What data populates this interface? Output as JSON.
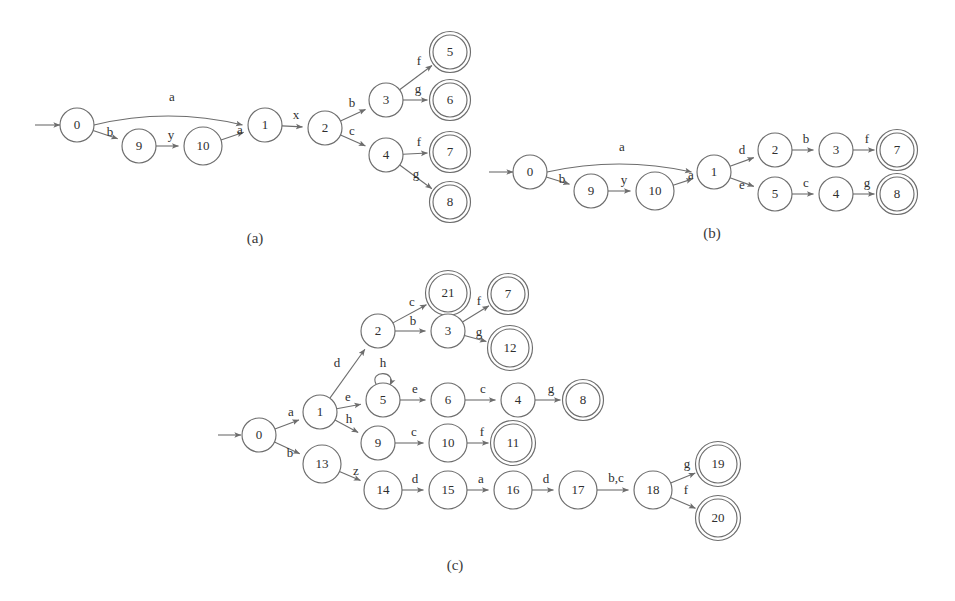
{
  "figure": {
    "type": "finite-state-automata-diagrams",
    "background_color": "#ffffff",
    "stroke_color": "#6d6d6d",
    "text_color": "#2f2f2f",
    "captions": [
      {
        "id": "caption-a",
        "text": "(a)",
        "x": 255,
        "y": 240
      },
      {
        "id": "caption-b",
        "text": "(b)",
        "x": 712,
        "y": 235
      },
      {
        "id": "caption-c",
        "text": "(c)",
        "x": 455,
        "y": 567
      }
    ],
    "diagrams": [
      {
        "id": "diagram-a",
        "caption": "(a)",
        "start_arrow": {
          "x1": 35,
          "y1": 125,
          "x2": 60,
          "y2": 125
        },
        "nodes": [
          {
            "id": "a0",
            "label": "0",
            "x": 77,
            "y": 125,
            "r": 17,
            "accepting": false
          },
          {
            "id": "a9",
            "label": "9",
            "x": 139,
            "y": 146,
            "r": 17,
            "accepting": false
          },
          {
            "id": "a10",
            "label": "10",
            "x": 203,
            "y": 146,
            "r": 19,
            "accepting": false
          },
          {
            "id": "a1",
            "label": "1",
            "x": 265,
            "y": 125,
            "r": 17,
            "accepting": false
          },
          {
            "id": "a2",
            "label": "2",
            "x": 325,
            "y": 128,
            "r": 17,
            "accepting": false
          },
          {
            "id": "a3",
            "label": "3",
            "x": 386,
            "y": 100,
            "r": 17,
            "accepting": false
          },
          {
            "id": "a4",
            "label": "4",
            "x": 386,
            "y": 155,
            "r": 17,
            "accepting": false
          },
          {
            "id": "a5",
            "label": "5",
            "x": 450,
            "y": 52,
            "r": 17,
            "accepting": true
          },
          {
            "id": "a6",
            "label": "6",
            "x": 450,
            "y": 100,
            "r": 17,
            "accepting": true
          },
          {
            "id": "a7",
            "label": "7",
            "x": 450,
            "y": 152,
            "r": 17,
            "accepting": true
          },
          {
            "id": "a8",
            "label": "8",
            "x": 450,
            "y": 202,
            "r": 17,
            "accepting": true
          }
        ],
        "edges": [
          {
            "id": "a-0-1",
            "from": "0",
            "to": "1",
            "label": "a",
            "label_x": 172,
            "label_y": 98,
            "curve": -18
          },
          {
            "id": "a-0-9",
            "from": "0",
            "to": "9",
            "label": "b",
            "label_x": 110,
            "label_y": 133,
            "curve": 0
          },
          {
            "id": "a-9-10",
            "from": "9",
            "to": "10",
            "label": "y",
            "label_x": 171,
            "label_y": 136,
            "curve": 0
          },
          {
            "id": "a-10-1",
            "from": "10",
            "to": "1",
            "label": "a",
            "label_x": 240,
            "label_y": 131,
            "curve": 0
          },
          {
            "id": "a-1-2",
            "from": "1",
            "to": "2",
            "label": "x",
            "label_x": 296,
            "label_y": 116,
            "curve": 0
          },
          {
            "id": "a-2-3",
            "from": "2",
            "to": "3",
            "label": "b",
            "label_x": 352,
            "label_y": 104,
            "curve": 0
          },
          {
            "id": "a-2-4",
            "from": "2",
            "to": "4",
            "label": "c",
            "label_x": 352,
            "label_y": 132,
            "curve": 0
          },
          {
            "id": "a-3-5",
            "from": "3",
            "to": "5",
            "label": "f",
            "label_x": 419,
            "label_y": 62,
            "curve": 0
          },
          {
            "id": "a-3-6",
            "from": "3",
            "to": "6",
            "label": "g",
            "label_x": 418,
            "label_y": 90,
            "curve": 0
          },
          {
            "id": "a-4-7",
            "from": "4",
            "to": "7",
            "label": "f",
            "label_x": 419,
            "label_y": 143,
            "curve": 0
          },
          {
            "id": "a-4-8",
            "from": "4",
            "to": "8",
            "label": "g",
            "label_x": 416,
            "label_y": 175,
            "curve": 0
          }
        ]
      },
      {
        "id": "diagram-b",
        "caption": "(b)",
        "start_arrow": {
          "x1": 489,
          "y1": 172,
          "x2": 513,
          "y2": 172
        },
        "nodes": [
          {
            "id": "b0",
            "label": "0",
            "x": 530,
            "y": 172,
            "r": 17,
            "accepting": false
          },
          {
            "id": "b9",
            "label": "9",
            "x": 591,
            "y": 191,
            "r": 17,
            "accepting": false
          },
          {
            "id": "b10",
            "label": "10",
            "x": 655,
            "y": 191,
            "r": 19,
            "accepting": false
          },
          {
            "id": "b1",
            "label": "1",
            "x": 714,
            "y": 172,
            "r": 17,
            "accepting": false
          },
          {
            "id": "b2",
            "label": "2",
            "x": 775,
            "y": 150,
            "r": 17,
            "accepting": false
          },
          {
            "id": "b3",
            "label": "3",
            "x": 836,
            "y": 150,
            "r": 17,
            "accepting": false
          },
          {
            "id": "b7",
            "label": "7",
            "x": 897,
            "y": 150,
            "r": 17,
            "accepting": true
          },
          {
            "id": "b5",
            "label": "5",
            "x": 775,
            "y": 194,
            "r": 17,
            "accepting": false
          },
          {
            "id": "b4",
            "label": "4",
            "x": 836,
            "y": 194,
            "r": 17,
            "accepting": false
          },
          {
            "id": "b8",
            "label": "8",
            "x": 897,
            "y": 194,
            "r": 17,
            "accepting": true
          }
        ],
        "edges": [
          {
            "id": "b-0-1",
            "from": "0",
            "to": "1",
            "label": "a",
            "label_x": 622,
            "label_y": 148,
            "curve": -16
          },
          {
            "id": "b-0-9",
            "from": "0",
            "to": "9",
            "label": "b",
            "label_x": 562,
            "label_y": 180,
            "curve": 0
          },
          {
            "id": "b-9-10",
            "from": "9",
            "to": "10",
            "label": "y",
            "label_x": 624,
            "label_y": 181,
            "curve": 0
          },
          {
            "id": "b-10-1",
            "from": "10",
            "to": "1",
            "label": "a",
            "label_x": 691,
            "label_y": 176,
            "curve": 0
          },
          {
            "id": "b-1-2",
            "from": "1",
            "to": "2",
            "label": "d",
            "label_x": 742,
            "label_y": 151,
            "curve": 0
          },
          {
            "id": "b-1-5",
            "from": "1",
            "to": "5",
            "label": "e",
            "label_x": 742,
            "label_y": 186,
            "curve": 0
          },
          {
            "id": "b-2-3",
            "from": "2",
            "to": "3",
            "label": "b",
            "label_x": 806,
            "label_y": 140,
            "curve": 0
          },
          {
            "id": "b-3-7",
            "from": "3",
            "to": "7",
            "label": "f",
            "label_x": 867,
            "label_y": 140,
            "curve": 0
          },
          {
            "id": "b-5-4",
            "from": "5",
            "to": "4",
            "label": "c",
            "label_x": 806,
            "label_y": 184,
            "curve": 0
          },
          {
            "id": "b-4-8",
            "from": "4",
            "to": "8",
            "label": "g",
            "label_x": 867,
            "label_y": 184,
            "curve": 0
          }
        ]
      },
      {
        "id": "diagram-c",
        "caption": "(c)",
        "start_arrow": {
          "x1": 218,
          "y1": 435,
          "x2": 241,
          "y2": 435
        },
        "nodes": [
          {
            "id": "c0",
            "label": "0",
            "x": 259,
            "y": 435,
            "r": 17,
            "accepting": false
          },
          {
            "id": "c1",
            "label": "1",
            "x": 320,
            "y": 412,
            "r": 17,
            "accepting": false
          },
          {
            "id": "c13",
            "label": "13",
            "x": 322,
            "y": 464,
            "r": 19,
            "accepting": false
          },
          {
            "id": "c2",
            "label": "2",
            "x": 378,
            "y": 331,
            "r": 17,
            "accepting": false
          },
          {
            "id": "c21",
            "label": "21",
            "x": 448,
            "y": 293,
            "r": 19,
            "accepting": true
          },
          {
            "id": "c3",
            "label": "3",
            "x": 448,
            "y": 331,
            "r": 17,
            "accepting": false
          },
          {
            "id": "c7",
            "label": "7",
            "x": 508,
            "y": 294,
            "r": 17,
            "accepting": true
          },
          {
            "id": "c12",
            "label": "12",
            "x": 510,
            "y": 348,
            "r": 19,
            "accepting": true
          },
          {
            "id": "c5",
            "label": "5",
            "x": 383,
            "y": 400,
            "r": 17,
            "accepting": false
          },
          {
            "id": "c6",
            "label": "6",
            "x": 448,
            "y": 400,
            "r": 17,
            "accepting": false
          },
          {
            "id": "c4",
            "label": "4",
            "x": 518,
            "y": 400,
            "r": 17,
            "accepting": false
          },
          {
            "id": "c8",
            "label": "8",
            "x": 583,
            "y": 400,
            "r": 17,
            "accepting": true
          },
          {
            "id": "c9",
            "label": "9",
            "x": 378,
            "y": 443,
            "r": 17,
            "accepting": false
          },
          {
            "id": "c10",
            "label": "10",
            "x": 448,
            "y": 443,
            "r": 19,
            "accepting": false
          },
          {
            "id": "c11",
            "label": "11",
            "x": 513,
            "y": 443,
            "r": 19,
            "accepting": true
          },
          {
            "id": "c14",
            "label": "14",
            "x": 383,
            "y": 490,
            "r": 19,
            "accepting": false
          },
          {
            "id": "c15",
            "label": "15",
            "x": 448,
            "y": 490,
            "r": 19,
            "accepting": false
          },
          {
            "id": "c16",
            "label": "16",
            "x": 513,
            "y": 490,
            "r": 19,
            "accepting": false
          },
          {
            "id": "c17",
            "label": "17",
            "x": 578,
            "y": 490,
            "r": 19,
            "accepting": false
          },
          {
            "id": "c18",
            "label": "18",
            "x": 653,
            "y": 490,
            "r": 19,
            "accepting": false
          },
          {
            "id": "c19",
            "label": "19",
            "x": 718,
            "y": 464,
            "r": 19,
            "accepting": true
          },
          {
            "id": "c20",
            "label": "20",
            "x": 718,
            "y": 518,
            "r": 19,
            "accepting": true
          }
        ],
        "edges": [
          {
            "id": "c-0-1",
            "from": "0",
            "to": "1",
            "label": "a",
            "label_x": 291,
            "label_y": 413,
            "curve": 0
          },
          {
            "id": "c-0-13",
            "from": "0",
            "to": "13",
            "label": "b",
            "label_x": 290,
            "label_y": 454,
            "curve": 0
          },
          {
            "id": "c-1-2",
            "from": "1",
            "to": "2",
            "label": "d",
            "label_x": 337,
            "label_y": 364,
            "curve": 0
          },
          {
            "id": "c-1-5",
            "from": "1",
            "to": "5",
            "label": "e",
            "label_x": 348,
            "label_y": 398,
            "curve": 0
          },
          {
            "id": "c-1-9",
            "from": "1",
            "to": "9",
            "label": "h",
            "label_x": 349,
            "label_y": 420,
            "curve": 0
          },
          {
            "id": "c-2-21",
            "from": "2",
            "to": "21",
            "label": "c",
            "label_x": 412,
            "label_y": 303,
            "curve": 0
          },
          {
            "id": "c-2-3",
            "from": "2",
            "to": "3",
            "label": "b",
            "label_x": 413,
            "label_y": 322,
            "curve": 0
          },
          {
            "id": "c-3-7",
            "from": "3",
            "to": "7",
            "label": "f",
            "label_x": 479,
            "label_y": 302,
            "curve": 0
          },
          {
            "id": "c-3-12",
            "from": "3",
            "to": "12",
            "label": "g",
            "label_x": 479,
            "label_y": 333,
            "curve": 0
          },
          {
            "id": "c-5-5",
            "from": "5",
            "to": "5",
            "label": "h",
            "label_x": 383,
            "label_y": 364,
            "self_loop": true
          },
          {
            "id": "c-5-6",
            "from": "5",
            "to": "6",
            "label": "e",
            "label_x": 415,
            "label_y": 390,
            "curve": 0
          },
          {
            "id": "c-6-4",
            "from": "6",
            "to": "4",
            "label": "c",
            "label_x": 483,
            "label_y": 390,
            "curve": 0
          },
          {
            "id": "c-4-8",
            "from": "4",
            "to": "8",
            "label": "g",
            "label_x": 551,
            "label_y": 390,
            "curve": 0
          },
          {
            "id": "c-9-10",
            "from": "9",
            "to": "10",
            "label": "c",
            "label_x": 414,
            "label_y": 433,
            "curve": 0
          },
          {
            "id": "c-10-11",
            "from": "10",
            "to": "11",
            "label": "f",
            "label_x": 482,
            "label_y": 433,
            "curve": 0
          },
          {
            "id": "c-13-14",
            "from": "13",
            "to": "14",
            "label": "z",
            "label_x": 356,
            "label_y": 472,
            "curve": 0
          },
          {
            "id": "c-14-15",
            "from": "14",
            "to": "15",
            "label": "d",
            "label_x": 415,
            "label_y": 480,
            "curve": 0
          },
          {
            "id": "c-15-16",
            "from": "15",
            "to": "16",
            "label": "a",
            "label_x": 481,
            "label_y": 480,
            "curve": 0
          },
          {
            "id": "c-16-17",
            "from": "16",
            "to": "17",
            "label": "d",
            "label_x": 546,
            "label_y": 480,
            "curve": 0
          },
          {
            "id": "c-17-18",
            "from": "17",
            "to": "18",
            "label": "b,c",
            "label_x": 616,
            "label_y": 479,
            "curve": 0
          },
          {
            "id": "c-18-19",
            "from": "18",
            "to": "19",
            "label": "g",
            "label_x": 687,
            "label_y": 465,
            "curve": 0
          },
          {
            "id": "c-18-20",
            "from": "18",
            "to": "20",
            "label": "f",
            "label_x": 686,
            "label_y": 491,
            "curve": 0
          }
        ]
      }
    ]
  }
}
